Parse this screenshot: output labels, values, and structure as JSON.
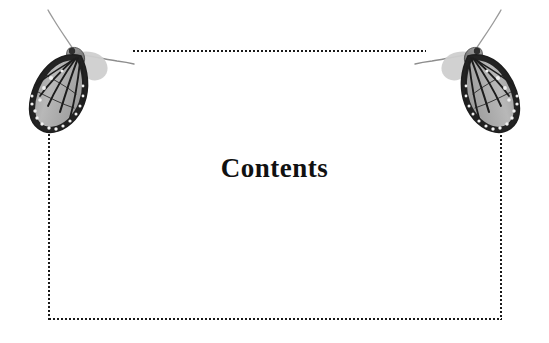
{
  "page": {
    "title": "Contents",
    "background_color": "#ffffff",
    "width": 549,
    "height": 343
  },
  "heading": {
    "text": "Contents"
  },
  "frame": {
    "style": "dotted",
    "color": "#1a1a1a",
    "dot_size_px": 2,
    "dot_pitch_px": 4,
    "segments": [
      {
        "name": "top",
        "orientation": "horizontal",
        "x": 132,
        "y": 50,
        "length": 294
      },
      {
        "name": "bottom",
        "orientation": "horizontal",
        "x": 48,
        "y": 318,
        "length": 454
      },
      {
        "name": "left",
        "orientation": "vertical",
        "x": 48,
        "y": 125,
        "length": 195
      },
      {
        "name": "right",
        "orientation": "vertical",
        "x": 500,
        "y": 122,
        "length": 198
      }
    ]
  },
  "decorations": [
    {
      "name": "butterfly-left",
      "subject": "monarch butterfly",
      "rendering": "grayscale photograph",
      "pose": "wings folded, head up, antennae extended right",
      "x": 18,
      "y": 8
    },
    {
      "name": "butterfly-right",
      "subject": "monarch butterfly",
      "rendering": "grayscale photograph",
      "pose": "mirrored, wings folded, head up, antennae extended left",
      "x": 411,
      "y": 8
    }
  ],
  "colors": {
    "wing_light": "#b4b4b4",
    "wing_mid": "#8a8a8a",
    "wing_dark": "#2b2b2b",
    "vein": "#1c1c1c",
    "spot": "#f2f2f2",
    "body": "#6e6e6e",
    "antenna": "#8d8d8d"
  }
}
